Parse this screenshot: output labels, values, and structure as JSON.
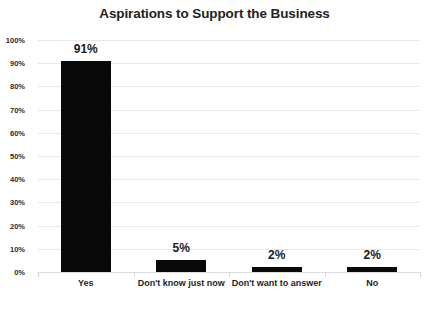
{
  "chart_data": {
    "type": "bar",
    "title": "Aspirations to Support the Business",
    "xlabel": "",
    "ylabel": "",
    "categories": [
      "Yes",
      "Don't know just now",
      "Don't want to answer",
      "No"
    ],
    "values": [
      91,
      5,
      2,
      2
    ],
    "value_labels": [
      "91%",
      "5%",
      "2%",
      "2%"
    ],
    "ylim": [
      0,
      100
    ],
    "ytick_labels": [
      "100%",
      "90%",
      "80%",
      "70%",
      "60%",
      "50%",
      "40%",
      "30%",
      "20%",
      "10%",
      "0%"
    ],
    "ytick_values": [
      100,
      90,
      80,
      70,
      60,
      50,
      40,
      30,
      20,
      10,
      0
    ],
    "grid": true,
    "legend": false,
    "legend_position": "none",
    "bar_color": "#090909",
    "grid_color": "#e8e8e8",
    "title_color": "#222222",
    "background_color": "#ffffff"
  }
}
